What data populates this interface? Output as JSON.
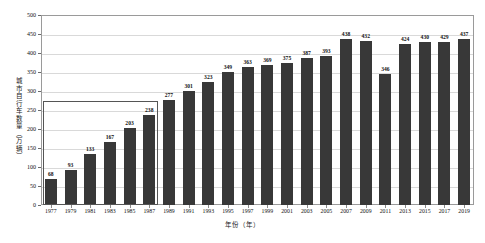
{
  "chart_data": {
    "type": "bar",
    "title": "",
    "xlabel": "年份（年）",
    "ylabel": "城市自行车数量（万辆）",
    "ylim": [
      0,
      500
    ],
    "yticks": [
      0,
      50,
      100,
      150,
      200,
      250,
      300,
      350,
      400,
      450,
      500
    ],
    "grid": true,
    "legend": "none",
    "categories": [
      "1977",
      "1979",
      "1981",
      "1983",
      "1985",
      "1987",
      "1989",
      "1991",
      "1993",
      "1995",
      "1997",
      "1999",
      "2001",
      "2003",
      "2005",
      "2007",
      "2009",
      "2011",
      "2013",
      "2015",
      "2017",
      "2019"
    ],
    "values": [
      68,
      93,
      133,
      167,
      203,
      238,
      277,
      301,
      323,
      349,
      363,
      369,
      375,
      387,
      393,
      438,
      432,
      346,
      424,
      430,
      429,
      437
    ],
    "bar_color": "#383838",
    "annotation": {
      "type": "highlight-rectangle",
      "covers_categories": [
        "1977",
        "1979",
        "1981",
        "1983",
        "1985",
        "1987"
      ],
      "top_value": 275,
      "border_color": "#555555"
    }
  },
  "axis": {
    "y_title": "城市自行车数量（万辆）",
    "x_title": "年份（年）"
  }
}
